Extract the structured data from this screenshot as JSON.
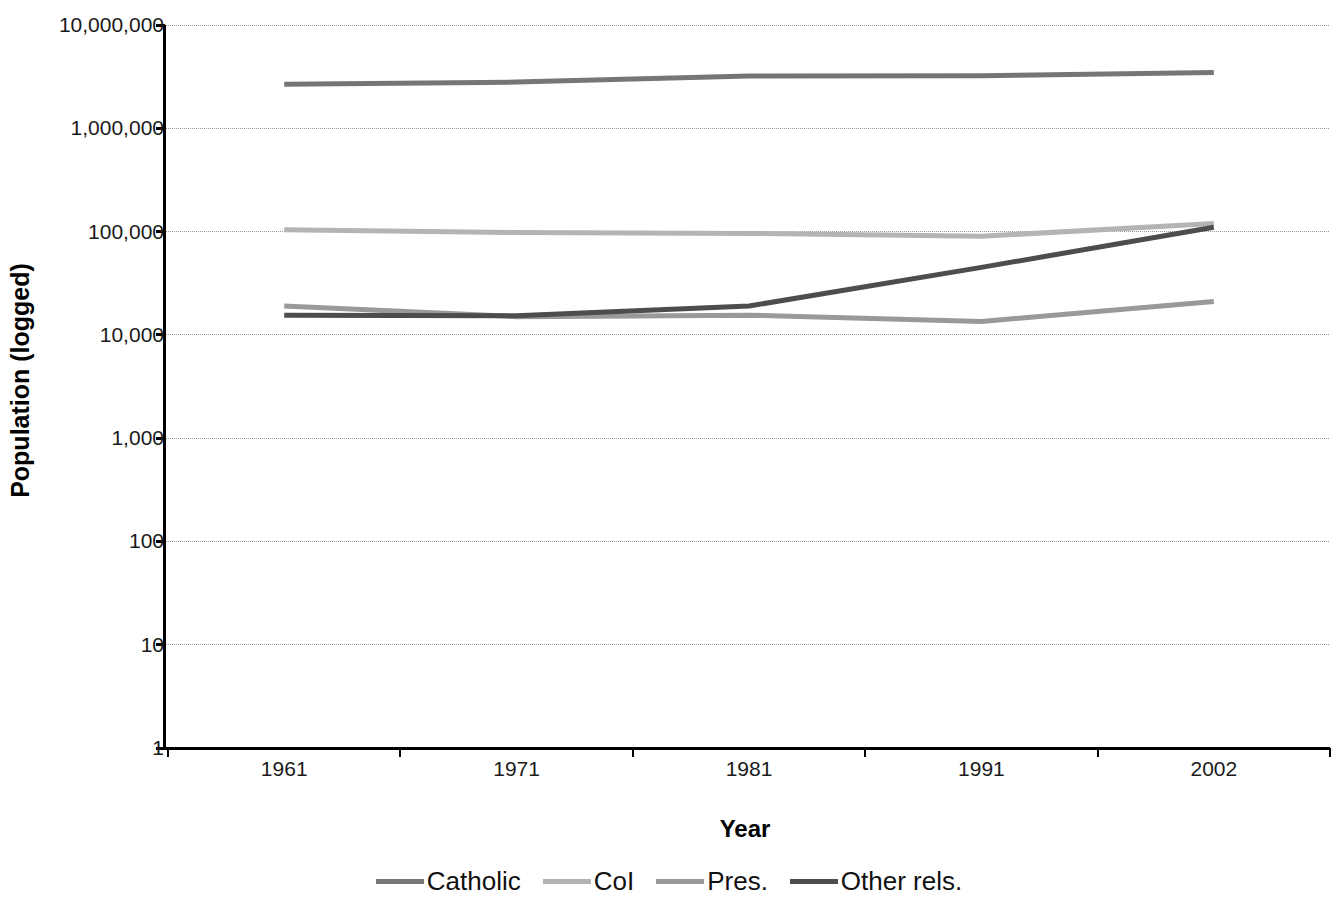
{
  "chart_data": {
    "type": "line",
    "title": "",
    "subtitle": "",
    "xlabel": "Year",
    "ylabel": "Population (logged)",
    "yscale": "log",
    "ylim": [
      1,
      10000000
    ],
    "grid": true,
    "legend_position": "bottom",
    "categories": [
      "1961",
      "1971",
      "1981",
      "1991",
      "2002"
    ],
    "y_ticks": [
      {
        "value": 10000000,
        "label": "10,000,000"
      },
      {
        "value": 1000000,
        "label": "1,000,000"
      },
      {
        "value": 100000,
        "label": "100,000"
      },
      {
        "value": 10000,
        "label": "10,000"
      },
      {
        "value": 1000,
        "label": "1,000"
      },
      {
        "value": 100,
        "label": "100"
      },
      {
        "value": 10,
        "label": "10"
      },
      {
        "value": 1,
        "label": "1"
      }
    ],
    "series": [
      {
        "name": "Catholic",
        "color": "#767676",
        "values": [
          2670000,
          2800000,
          3200000,
          3230000,
          3460000
        ]
      },
      {
        "name": "CoI",
        "color": "#b4b4b4",
        "values": [
          104000,
          98000,
          96000,
          90000,
          120000
        ]
      },
      {
        "name": "Pres.",
        "color": "#999999",
        "values": [
          19000,
          15000,
          15500,
          13500,
          21000
        ]
      },
      {
        "name": "Other rels.",
        "color": "#4d4d4d",
        "values": [
          15500,
          15300,
          19000,
          45000,
          110000
        ]
      }
    ]
  },
  "legend": {
    "items": [
      {
        "label": "Catholic",
        "color": "#767676"
      },
      {
        "label": "CoI",
        "color": "#b4b4b4"
      },
      {
        "label": "Pres.",
        "color": "#999999"
      },
      {
        "label": "Other rels.",
        "color": "#4d4d4d"
      }
    ]
  },
  "axes": {
    "x_title": "Year",
    "y_title": "Population (logged)"
  }
}
